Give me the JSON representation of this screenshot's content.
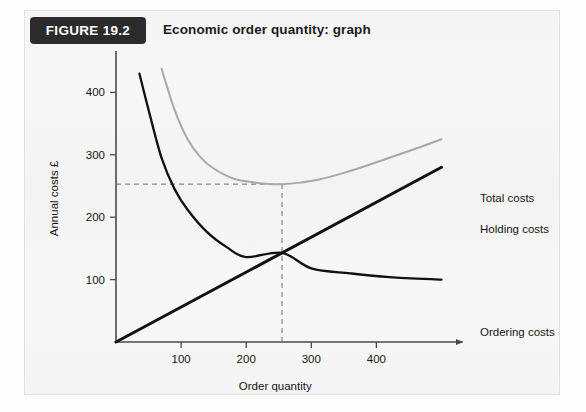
{
  "figure": {
    "tag_label": "FIGURE 19.2",
    "title": "Economic order quantity: graph"
  },
  "colors": {
    "panel_bg": "#f7f7f7",
    "panel_border": "#e2e2e2",
    "tag_bg": "#2b2b2b",
    "tag_text": "#ffffff",
    "title_text": "#1c1c1c",
    "axis": "#4a4a4a",
    "total_costs": "#a8a8a8",
    "holding_costs": "#111111",
    "ordering_costs": "#111111",
    "guide_dashed": "#6e6e6e"
  },
  "chart_data": {
    "type": "line",
    "title": "Economic order quantity: graph",
    "xlabel": "Order quantity",
    "ylabel": "Annual costs £",
    "xlim": [
      0,
      520
    ],
    "ylim": [
      0,
      460
    ],
    "xticks": [
      100,
      200,
      300,
      400
    ],
    "yticks": [
      100,
      200,
      300,
      400
    ],
    "xtick_labels": [
      "100",
      "200",
      "300",
      "400"
    ],
    "ytick_labels": [
      "100",
      "200",
      "300",
      "400"
    ],
    "grid": false,
    "legend_position": "right-inline-labels",
    "annotations": [
      {
        "name": "eoq-vertical-guide",
        "type": "dashed-vertical",
        "x": 255,
        "y_from": 0,
        "y_to": 253
      },
      {
        "name": "total-cost-minimum-guide",
        "type": "dashed-horizontal",
        "y": 253,
        "x_from": 0,
        "x_to": 255
      }
    ],
    "series": [
      {
        "name": "Total costs",
        "label": "Total costs",
        "color": "#a8a8a8",
        "label_x": 455,
        "label_y": 151,
        "x": [
          70,
          90,
          110,
          130,
          150,
          180,
          210,
          240,
          255,
          280,
          310,
          350,
          400,
          450,
          500
        ],
        "y": [
          438,
          372,
          325,
          296,
          278,
          262,
          256,
          253,
          253,
          255,
          260,
          271,
          288,
          306,
          325
        ]
      },
      {
        "name": "Holding costs",
        "label": "Holding costs",
        "color": "#111111",
        "label_x": 455,
        "label_y": 182,
        "x": [
          0,
          100,
          200,
          255,
          300,
          400,
          500
        ],
        "y": [
          0,
          56,
          112,
          143,
          168,
          224,
          280
        ]
      },
      {
        "name": "Ordering costs",
        "label": "Ordering costs",
        "color": "#111111",
        "label_x": 455,
        "label_y": 285,
        "x": [
          36,
          50,
          70,
          90,
          110,
          140,
          170,
          200,
          255,
          300,
          360,
          420,
          500
        ],
        "y": [
          430,
          372,
          295,
          245,
          212,
          176,
          152,
          136,
          143,
          118,
          110,
          104,
          100
        ]
      }
    ]
  },
  "ghost_text": [
    {
      "name": "ghost-line-1",
      "text": " ",
      "left": 150,
      "top": 56
    },
    {
      "name": "ghost-line-2",
      "text": " ",
      "left": 150,
      "top": 76
    },
    {
      "name": "ghost-right-block",
      "text": " ",
      "left": 445,
      "top": 250
    }
  ]
}
